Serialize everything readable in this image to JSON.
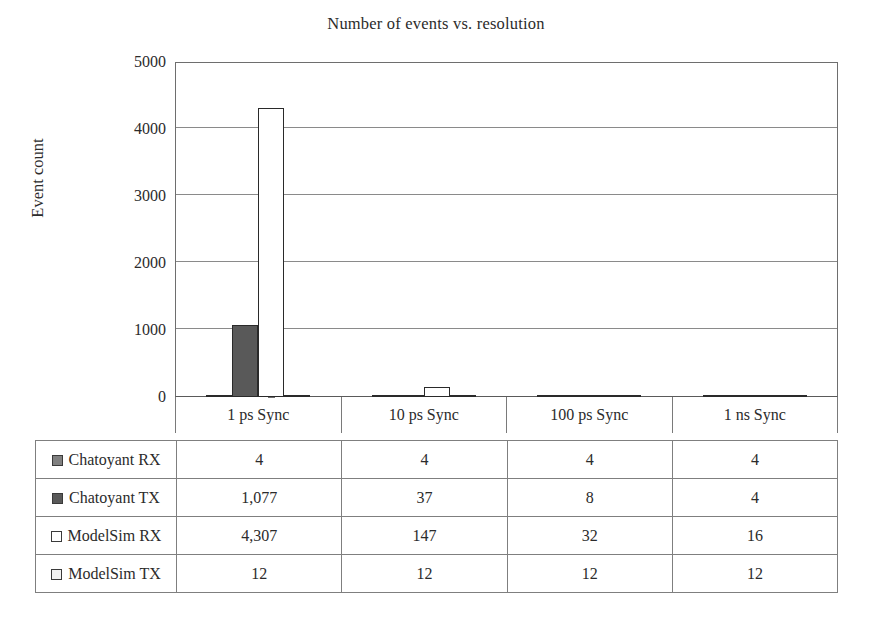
{
  "chart_data": {
    "type": "bar",
    "title": "Number of events vs. resolution",
    "xlabel": "",
    "ylabel": "Event count",
    "ylim": [
      0,
      5000
    ],
    "yticks": [
      0,
      1000,
      2000,
      3000,
      4000,
      5000
    ],
    "ytick_labels": [
      "0",
      "1000",
      "2000",
      "3000",
      "4000",
      "5000"
    ],
    "grid": true,
    "legend_position": "table-below",
    "categories": [
      "1 ps Sync",
      "10 ps Sync",
      "100 ps Sync",
      "1 ns Sync"
    ],
    "series": [
      {
        "name": "Chatoyant RX",
        "color": "#808080",
        "values": [
          4,
          4,
          4,
          4
        ],
        "labels": [
          "4",
          "4",
          "4",
          "4"
        ]
      },
      {
        "name": "Chatoyant TX",
        "color": "#595959",
        "values": [
          1077,
          37,
          8,
          4
        ],
        "labels": [
          "1,077",
          "37",
          "8",
          "4"
        ]
      },
      {
        "name": "ModelSim RX",
        "color": "#ffffff",
        "values": [
          4307,
          147,
          32,
          16
        ],
        "labels": [
          "4,307",
          "147",
          "32",
          "16"
        ]
      },
      {
        "name": "ModelSim TX",
        "color": "#f2f2f2",
        "values": [
          12,
          12,
          12,
          12
        ],
        "labels": [
          "12",
          "12",
          "12",
          "12"
        ]
      }
    ]
  },
  "table": {
    "rows": [
      {
        "label": "Chatoyant RX",
        "swatch": "#808080",
        "cells": [
          "4",
          "4",
          "4",
          "4"
        ]
      },
      {
        "label": "Chatoyant TX",
        "swatch": "#595959",
        "cells": [
          "1,077",
          "37",
          "8",
          "4"
        ]
      },
      {
        "label": "ModelSim RX",
        "swatch": "#ffffff",
        "cells": [
          "4,307",
          "147",
          "32",
          "16"
        ]
      },
      {
        "label": "ModelSim TX",
        "swatch": "#f2f2f2",
        "cells": [
          "12",
          "12",
          "12",
          "12"
        ]
      }
    ]
  },
  "colors": {
    "axis": "#6e6e6e",
    "grid": "#8a8a8a",
    "text": "#2b2b2b",
    "bar_outline": "#2a2a2a",
    "table_border": "#7f7f7f"
  }
}
